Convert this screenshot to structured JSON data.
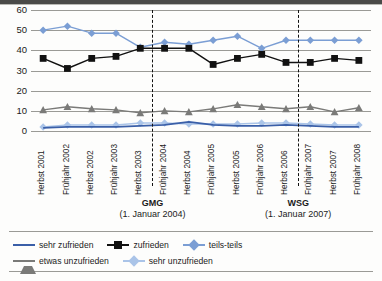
{
  "chart_data": {
    "type": "line",
    "title": "",
    "xlabel": "",
    "ylabel": "",
    "ylim": [
      0,
      60
    ],
    "yticks": [
      0,
      10,
      20,
      30,
      40,
      50,
      60
    ],
    "grid": true,
    "legend_position": "bottom",
    "categories": [
      "Herbst 2001",
      "Frühjahr 2002",
      "Herbst 2002",
      "Frühjahr 2003",
      "Herbst 2003",
      "Frühjahr 2004",
      "Herbst 2004",
      "Frühjahr 2005",
      "Herbst 2005",
      "Frühjahr 2006",
      "Herbst 2006",
      "Frühjahr 2007",
      "Herbst 2007",
      "Frühjahr 2008"
    ],
    "series": [
      {
        "name": "sehr zufrieden",
        "color": "#3a5fa8",
        "marker": "none",
        "values": [
          1.5,
          2.0,
          2.0,
          2.0,
          2.5,
          3.0,
          4.5,
          3.0,
          2.5,
          2.5,
          3.0,
          2.5,
          2.0,
          2.0
        ]
      },
      {
        "name": "zufrieden",
        "color": "#111111",
        "marker": "square",
        "values": [
          36,
          31,
          36,
          37,
          41,
          41,
          41,
          33,
          36,
          38,
          34,
          34,
          36,
          35
        ]
      },
      {
        "name": "teils-teils",
        "color": "#7b9ed4",
        "marker": "diamond",
        "values": [
          50,
          52,
          48.5,
          48.5,
          41.5,
          44,
          43,
          45,
          47,
          41,
          45,
          45,
          45,
          45
        ]
      },
      {
        "name": "etwas unzufrieden",
        "color": "#7a7a78",
        "marker": "triangle",
        "values": [
          10.5,
          12,
          11,
          10.5,
          9,
          10,
          9.5,
          11,
          13,
          12,
          11,
          12,
          9.5,
          11.5
        ]
      },
      {
        "name": "sehr unzufrieden",
        "color": "#aac4e8",
        "marker": "diamond",
        "values": [
          2,
          3,
          3,
          3,
          4,
          4,
          3.5,
          3.5,
          3.5,
          4,
          4,
          3.5,
          3,
          3
        ]
      }
    ],
    "annotations": [
      {
        "id": "gmg",
        "name": "GMG",
        "date": "(1. Januar 2004)",
        "at_category_index": 4.5
      },
      {
        "id": "wsg",
        "name": "WSG",
        "date": "(1. Januar 2007)",
        "at_category_index": 10.5
      }
    ]
  }
}
